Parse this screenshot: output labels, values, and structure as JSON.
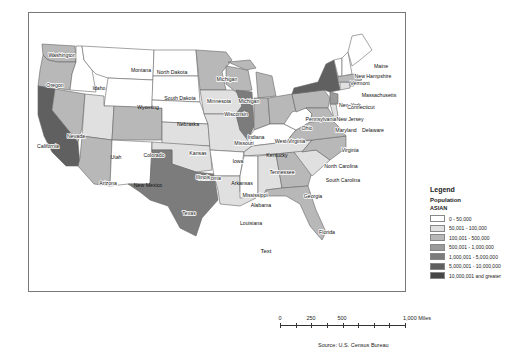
{
  "map": {
    "annotation_text": "Text",
    "states": [
      {
        "name": "Washington",
        "category": 3
      },
      {
        "name": "Oregon",
        "category": 3
      },
      {
        "name": "California",
        "category": 6
      },
      {
        "name": "Idaho",
        "category": 1
      },
      {
        "name": "Nevada",
        "category": 3
      },
      {
        "name": "Montana",
        "category": 1
      },
      {
        "name": "Wyoming",
        "category": 1
      },
      {
        "name": "Utah",
        "category": 2
      },
      {
        "name": "Arizona",
        "category": 3
      },
      {
        "name": "Colorado",
        "category": 3
      },
      {
        "name": "New Mexico",
        "category": 1
      },
      {
        "name": "North Dakota",
        "category": 1
      },
      {
        "name": "South Dakota",
        "category": 1
      },
      {
        "name": "Nebraska",
        "category": 1
      },
      {
        "name": "Kansas",
        "category": 2
      },
      {
        "name": "Oklahoma",
        "category": 2
      },
      {
        "name": "Texas",
        "category": 5
      },
      {
        "name": "Minnesota",
        "category": 3
      },
      {
        "name": "Iowa",
        "category": 2
      },
      {
        "name": "Missouri",
        "category": 2
      },
      {
        "name": "Arkansas",
        "category": 1
      },
      {
        "name": "Louisiana",
        "category": 2
      },
      {
        "name": "Wisconsin",
        "category": 3
      },
      {
        "name": "Illinois",
        "category": 5
      },
      {
        "name": "Michigan",
        "category": 3
      },
      {
        "name": "Indiana",
        "category": 3
      },
      {
        "name": "Ohio",
        "category": 3
      },
      {
        "name": "Kentucky",
        "category": 1
      },
      {
        "name": "Tennessee",
        "category": 2
      },
      {
        "name": "Mississippi",
        "category": 1
      },
      {
        "name": "Alabama",
        "category": 2
      },
      {
        "name": "Georgia",
        "category": 3
      },
      {
        "name": "Florida",
        "category": 3
      },
      {
        "name": "South Carolina",
        "category": 2
      },
      {
        "name": "North Carolina",
        "category": 3
      },
      {
        "name": "Virginia",
        "category": 3
      },
      {
        "name": "West Virginia",
        "category": 1
      },
      {
        "name": "Pennsylvania",
        "category": 3
      },
      {
        "name": "New York",
        "category": 5
      },
      {
        "name": "New Jersey",
        "category": 4
      },
      {
        "name": "Delaware",
        "category": 2
      },
      {
        "name": "Maryland",
        "category": 3
      },
      {
        "name": "Connecticut",
        "category": 2
      },
      {
        "name": "Rhode Island",
        "category": 2
      },
      {
        "name": "Massachusetts",
        "category": 3
      },
      {
        "name": "Vermont",
        "category": 1
      },
      {
        "name": "New Hampshire",
        "category": 1
      },
      {
        "name": "Maine",
        "category": 1
      }
    ]
  },
  "legend": {
    "title": "Legend",
    "subtitle": "Population",
    "field": "ASIAN",
    "classes": [
      {
        "label": "0 - 50,000",
        "color": "#ffffff"
      },
      {
        "label": "50,001 - 100,000",
        "color": "#e0e0e0"
      },
      {
        "label": "100,001 - 500,000",
        "color": "#b8b8b8"
      },
      {
        "label": "500,001 - 1,000,000",
        "color": "#9a9a9a"
      },
      {
        "label": "1,000,001 - 5,000,000",
        "color": "#7c7c7c"
      },
      {
        "label": "5,000,001 - 10,000,000",
        "color": "#606060"
      },
      {
        "label": "10,000,001 and greater",
        "color": "#474747"
      }
    ]
  },
  "scale_bar": {
    "ticks": [
      "0",
      "250",
      "500",
      "1,000 Miles"
    ]
  },
  "source": "Source: U.S. Census Bureau"
}
